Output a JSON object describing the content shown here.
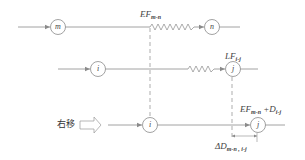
{
  "diagram": {
    "colors": {
      "line": "#8a8a8a",
      "text": "#444444",
      "background": "#ffffff"
    },
    "nodes": [
      {
        "id": "m",
        "label": "m",
        "row": 1
      },
      {
        "id": "n",
        "label": "n",
        "row": 1
      },
      {
        "id": "i_top",
        "label": "i",
        "row": 2
      },
      {
        "id": "j_top",
        "label": "j",
        "row": 2
      },
      {
        "id": "i_bottom",
        "label": "i",
        "row": 3
      },
      {
        "id": "j_bottom",
        "label": "j",
        "row": 3
      }
    ],
    "labels": {
      "ef_mn": {
        "main": "EF",
        "sub": "m-n"
      },
      "lf_ij": {
        "main": "LF",
        "sub": "i-j"
      },
      "ef_plus_d": {
        "main": "EF",
        "sub": "m-n",
        "plus": " +D",
        "sub2": "i-j"
      },
      "delta_d": {
        "main": "ΔD",
        "sub": "m-n , i-j"
      }
    },
    "shift_label": "右移"
  }
}
